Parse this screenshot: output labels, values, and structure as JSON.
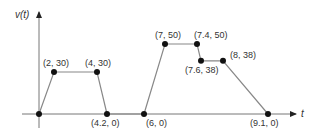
{
  "chart_data": {
    "type": "line",
    "title": "",
    "xlabel": "t",
    "ylabel": "v(t)",
    "grid": false,
    "legend": null,
    "x": [
      0,
      2,
      4,
      4.2,
      6,
      7,
      7.4,
      7.6,
      8,
      9.1
    ],
    "series": [
      {
        "name": "v(t)",
        "segments": [
          [
            [
              0,
              0
            ],
            [
              2,
              30
            ],
            [
              4,
              30
            ],
            [
              4.2,
              0
            ]
          ],
          [
            [
              4.2,
              0
            ],
            [
              6,
              0
            ]
          ],
          [
            [
              6,
              0
            ],
            [
              7,
              50
            ],
            [
              7.4,
              50
            ],
            [
              7.6,
              38
            ],
            [
              8,
              38
            ],
            [
              9.1,
              0
            ]
          ]
        ],
        "values": [
          0,
          30,
          30,
          0,
          0,
          50,
          50,
          38,
          38,
          0
        ]
      }
    ],
    "annotations": [
      {
        "text": "(2, 30)",
        "x": 2,
        "y": 30
      },
      {
        "text": "(4, 30)",
        "x": 4,
        "y": 30
      },
      {
        "text": "(4.2, 0)",
        "x": 4.2,
        "y": 0
      },
      {
        "text": "(6, 0)",
        "x": 6,
        "y": 0
      },
      {
        "text": "(7, 50)",
        "x": 7,
        "y": 50
      },
      {
        "text": "(7.4, 50)",
        "x": 7.4,
        "y": 50
      },
      {
        "text": "(7.6, 38)",
        "x": 7.6,
        "y": 38
      },
      {
        "text": "(8, 38)",
        "x": 8,
        "y": 38
      },
      {
        "text": "(9.1, 0)",
        "x": 9.1,
        "y": 0
      }
    ],
    "colors": {
      "line": "#888888",
      "axis": "#777777",
      "point": "#111111",
      "label": "#333333"
    }
  }
}
